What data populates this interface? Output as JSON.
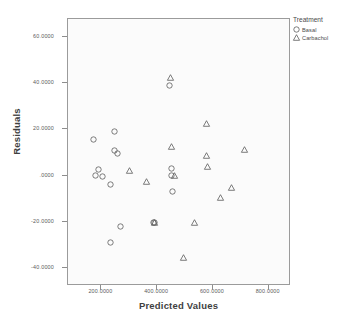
{
  "chart_data": {
    "type": "scatter",
    "title": "",
    "xlabel": "Predicted Values",
    "ylabel": "Residuals",
    "xlim": [
      80,
      880
    ],
    "ylim": [
      -48,
      68
    ],
    "grid": false,
    "xticks": [
      "200.0000",
      "400.0000",
      "600.0000",
      "800.0000"
    ],
    "xtick_values": [
      200,
      400,
      600,
      800
    ],
    "yticks": [
      "60.0000",
      "40.0000",
      "20.0000",
      ".0000",
      "-20.0000",
      "-40.0000"
    ],
    "ytick_values": [
      60,
      40,
      20,
      0,
      -20,
      -40
    ],
    "legend": {
      "title": "Treatment",
      "position": "top-right",
      "entries": [
        {
          "label": "Basal",
          "marker": "circle"
        },
        {
          "label": "Carbachol",
          "marker": "triangle"
        }
      ]
    },
    "series": [
      {
        "name": "Basal",
        "marker": "circle",
        "points": [
          [
            172,
            15.8
          ],
          [
            190,
            2.4
          ],
          [
            178,
            -0.2
          ],
          [
            203,
            -0.4
          ],
          [
            246,
            19.0
          ],
          [
            248,
            11.0
          ],
          [
            258,
            9.6
          ],
          [
            233,
            -4.0
          ],
          [
            268,
            -22.2
          ],
          [
            231,
            -29.0
          ],
          [
            387,
            -20.2
          ],
          [
            392,
            -20.6
          ],
          [
            451,
            3.2
          ],
          [
            450,
            -0.1
          ],
          [
            444,
            39.2
          ],
          [
            455,
            -6.8
          ]
        ]
      },
      {
        "name": "Carbachol",
        "marker": "triangle",
        "points": [
          [
            301,
            2.3
          ],
          [
            363,
            -2.4
          ],
          [
            392,
            -20.4
          ],
          [
            449,
            42.4
          ],
          [
            452,
            12.6
          ],
          [
            463,
            0.2
          ],
          [
            495,
            -35.8
          ],
          [
            535,
            -20.6
          ],
          [
            578,
            22.6
          ],
          [
            578,
            8.6
          ],
          [
            580,
            3.8
          ],
          [
            628,
            -9.6
          ],
          [
            668,
            -5.2
          ],
          [
            713,
            11.2
          ]
        ]
      }
    ]
  }
}
